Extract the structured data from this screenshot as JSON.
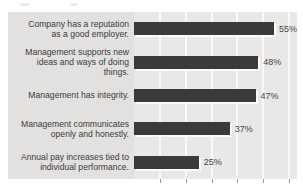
{
  "chart_data": {
    "type": "bar",
    "orientation": "horizontal",
    "title": "",
    "categories": [
      "Company has a reputation as a good employer.",
      "Management supports new ideas and ways of doing things.",
      "Management has integrity.",
      "Management communicates openly and honestly.",
      "Annual pay increases tied to individual performance."
    ],
    "values": [
      55,
      48,
      47,
      37,
      25
    ],
    "value_labels": [
      "55%",
      "48%",
      "47%",
      "37%",
      "25%"
    ],
    "xlabel": "",
    "ylabel": "",
    "xlim": [
      0,
      63
    ],
    "x_tick_values": [
      10,
      20,
      30,
      40,
      50,
      60
    ],
    "grid": "vertical white gridlines on",
    "legend": "none",
    "colors": {
      "bar": "#3a3a3a",
      "bar_highlight": "#fcfcfc",
      "panel_bg": "#e2e1e0",
      "plot_bg": "#e9e8e6",
      "gridline": "#ffffff",
      "tick": "#9a9a9a",
      "category_text": "#3b3b3b",
      "value_text": "#454545",
      "page_bg": "#ffffff"
    }
  }
}
